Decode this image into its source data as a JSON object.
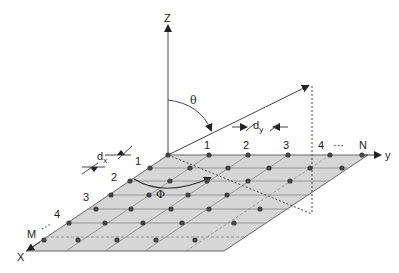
{
  "diagram": {
    "axes": {
      "z_label": "Z",
      "y_label": "y",
      "x_label": "X"
    },
    "angles": {
      "theta_label": "θ",
      "phi_label": "Φ"
    },
    "spacing": {
      "dx_label": "d",
      "dx_sub": "x",
      "dy_label": "d",
      "dy_sub": "y"
    },
    "y_indices": [
      "1",
      "2",
      "3",
      "4",
      "···",
      "N"
    ],
    "x_indices": [
      "1",
      "2",
      "3",
      "4",
      "···",
      "M"
    ],
    "colors": {
      "plane_fill": "#d6d6d6",
      "line": "#555555",
      "dot": "#444444",
      "text": "#222222"
    }
  }
}
